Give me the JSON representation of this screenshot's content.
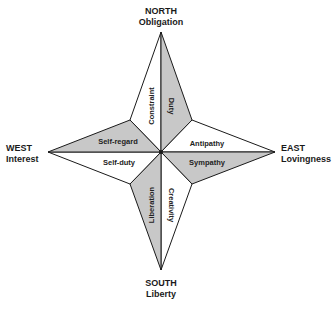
{
  "directions": {
    "north": {
      "title": "NORTH",
      "subtitle": "Obligation"
    },
    "south": {
      "title": "SOUTH",
      "subtitle": "Liberty"
    },
    "west": {
      "title": "WEST",
      "subtitle": "Interest"
    },
    "east": {
      "title": "EAST",
      "subtitle": "Lovingness"
    }
  },
  "segments": {
    "constraint": "Constraint",
    "duty": "Duty",
    "antipathy": "Antipathy",
    "sympathy": "Sympathy",
    "creativity": "Creativity",
    "liberation": "Liberation",
    "self_duty": "Self-duty",
    "self_regard": "Self-regard"
  },
  "colors": {
    "shaded": "#c8c8c8",
    "unshaded": "#ffffff",
    "stroke": "#1a1a1a"
  }
}
